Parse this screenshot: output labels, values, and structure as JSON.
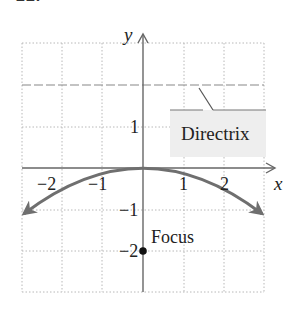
{
  "problem_number": "22.",
  "figure": {
    "equation_implied": "x^2 = -8y",
    "axes": {
      "x_label": "x",
      "y_label": "y",
      "x_ticks": [
        "−2",
        "−1",
        "1",
        "2"
      ],
      "y_ticks": [
        "1",
        "−1",
        "−2"
      ],
      "xlim": [
        -3,
        3
      ],
      "ylim": [
        -3,
        3
      ],
      "grid": true
    },
    "directrix": {
      "label": "Directrix",
      "y": 2
    },
    "focus": {
      "label": "Focus",
      "x": 0,
      "y": -2
    },
    "vertex": {
      "x": 0,
      "y": 0
    },
    "curve": {
      "color": "#6f6f6f",
      "x_range": [
        -3,
        3
      ]
    },
    "colors": {
      "axis": "#666666",
      "grid": "#b8b8b8",
      "callout_fill": "#eeeeee",
      "callout_border": "#777777",
      "focus_dot": "#111111"
    }
  }
}
